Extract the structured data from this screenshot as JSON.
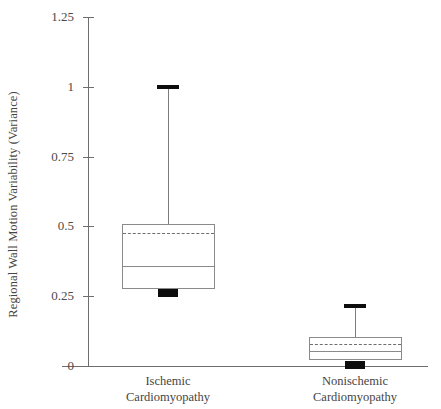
{
  "chart_data": {
    "type": "box",
    "title": "",
    "xlabel": "",
    "ylabel": "Regional Wall Motion Variability (Variance)",
    "ylim": [
      0,
      1.25
    ],
    "yticks": [
      0,
      0.25,
      0.5,
      0.75,
      1,
      1.25
    ],
    "ytick_labels": [
      "0",
      "0.25",
      "0.5",
      "0.75",
      "1",
      "1.25"
    ],
    "grid": false,
    "legend": null,
    "categories": [
      "Ischemic Cardiomyopathy",
      "Nonischemic Cardiomyopathy"
    ],
    "category_lines": [
      [
        "Ischemic",
        "Cardiomyopathy"
      ],
      [
        "Nonischemic",
        "Cardiomyopathy"
      ]
    ],
    "boxes": [
      {
        "name": "Ischemic Cardiomyopathy",
        "whisker_high": 1.0,
        "q3": 0.51,
        "mean": 0.475,
        "median": 0.36,
        "q1": 0.275,
        "whisker_low": 0.26
      },
      {
        "name": "Nonischemic Cardiomyopathy",
        "whisker_high": 0.215,
        "q3": 0.105,
        "mean": 0.08,
        "median": 0.055,
        "q1": 0.02,
        "whisker_low": 0.005
      }
    ],
    "colors": {
      "background": "#ffffff",
      "axis": "#6e6e6e",
      "box_edge": "#8a8a8a",
      "median": "#8a8a8a",
      "mean_dashed": "#6e6e6e",
      "cap_block": "#0d0d0d",
      "text": "#454545"
    }
  }
}
